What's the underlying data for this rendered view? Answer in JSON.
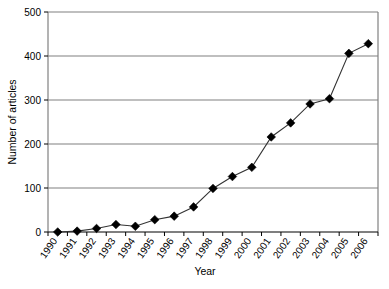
{
  "chart_data": {
    "type": "line",
    "title": "",
    "xlabel": "Year",
    "ylabel": "Number of articles",
    "categories": [
      "1990",
      "1991",
      "1992",
      "1993",
      "1994",
      "1995",
      "1996",
      "1997",
      "1998",
      "1999",
      "2000",
      "2001",
      "2002",
      "2003",
      "2004",
      "2005",
      "2006"
    ],
    "values": [
      0,
      2,
      8,
      17,
      13,
      28,
      36,
      57,
      99,
      126,
      147,
      216,
      248,
      291,
      303,
      406,
      428
    ],
    "ylim": [
      0,
      500
    ],
    "yticks": [
      "0",
      "100",
      "200",
      "300",
      "400",
      "500"
    ],
    "ytick_values": [
      0,
      100,
      200,
      300,
      400,
      500
    ],
    "grid": "horizontal",
    "legend": "none",
    "marker": "diamond",
    "line_color": "#333333",
    "marker_color": "#000000",
    "grid_color": "#808080",
    "axis_color": "#808080",
    "background": "#ffffff"
  },
  "axes": {
    "y_title": "Number of articles",
    "x_title": "Year"
  }
}
